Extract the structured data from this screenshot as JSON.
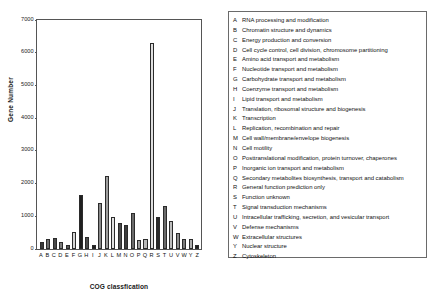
{
  "chart_data": {
    "type": "bar",
    "title": "",
    "xlabel": "COG classfication",
    "ylabel": "Gene Number",
    "ylim": [
      0,
      7000
    ],
    "yticks": [
      0,
      1000,
      2000,
      3000,
      4000,
      5000,
      6000,
      7000
    ],
    "ytick_labels": [
      "0",
      "1000",
      "2000",
      "3000",
      "4000",
      "5000",
      "6000",
      "7000"
    ],
    "grid": false,
    "legend_position": "right",
    "categories": [
      "A",
      "B",
      "C",
      "D",
      "E",
      "F",
      "G",
      "H",
      "I",
      "J",
      "K",
      "L",
      "M",
      "N",
      "O",
      "P",
      "Q",
      "R",
      "S",
      "T",
      "U",
      "V",
      "W",
      "Y",
      "Z"
    ],
    "values": [
      215,
      320,
      350,
      225,
      120,
      510,
      1650,
      380,
      110,
      1410,
      2230,
      985,
      800,
      740,
      1110,
      280,
      310,
      6300,
      985,
      1310,
      860,
      500,
      300,
      300,
      120
    ],
    "bar_colors": [
      "#3a3a3a",
      "#6e6e6e",
      "#4a4a4a",
      "#7d7d7d",
      "#5a5a5a",
      "#d6d6d6",
      "#1f1f1f",
      "#4e4e4e",
      "#1f1f1f",
      "#8a8a8a",
      "#9e9e9e",
      "#e2e2e2",
      "#4a4a4a",
      "#3d3d3d",
      "#6a6a6a",
      "#9a9a9a",
      "#b8b8b8",
      "#e0e0e0",
      "#2a2a2a",
      "#6a6a6a",
      "#bdbdbd",
      "#8e8e8e",
      "#7a7a7a",
      "#b0b0b0",
      "#1f1f1f"
    ],
    "legend_entries": [
      {
        "key": "A",
        "desc": "RNA processing and modification"
      },
      {
        "key": "B",
        "desc": "Chromatin structure and dynamics"
      },
      {
        "key": "C",
        "desc": "Energy production and conversion"
      },
      {
        "key": "D",
        "desc": "Cell cycle control, cell division, chromosome partitioning"
      },
      {
        "key": "E",
        "desc": "Amino acid transport and metabolism"
      },
      {
        "key": "F",
        "desc": "Nucleotide transport and metabolism"
      },
      {
        "key": "G",
        "desc": "Carbohydrate transport and metabolism"
      },
      {
        "key": "H",
        "desc": "Coenzyme transport and metabolism"
      },
      {
        "key": "I",
        "desc": "Lipid transport and metabolism"
      },
      {
        "key": "J",
        "desc": "Translation, ribosomal structure and biogenesis"
      },
      {
        "key": "K",
        "desc": "Transcription"
      },
      {
        "key": "L",
        "desc": "Replication, recombination and repair"
      },
      {
        "key": "M",
        "desc": "Cell wall/membrane/envelope biogenesis"
      },
      {
        "key": "N",
        "desc": "Cell motility"
      },
      {
        "key": "O",
        "desc": "Posttranslational modification, protein turnover, chaperones"
      },
      {
        "key": "P",
        "desc": "Inorganic ion transport and metabolism"
      },
      {
        "key": "Q",
        "desc": "Secondary metabolites biosynthesis, transport and catabolism"
      },
      {
        "key": "R",
        "desc": "General function prediction only"
      },
      {
        "key": "S",
        "desc": "Function unknown"
      },
      {
        "key": "T",
        "desc": "Signal transduction mechanisms"
      },
      {
        "key": "U",
        "desc": "Intracellular trafficking, secretion, and vesicular transport"
      },
      {
        "key": "V",
        "desc": "Defense mechanisms"
      },
      {
        "key": "W",
        "desc": "Extracellular structures"
      },
      {
        "key": "Y",
        "desc": "Nuclear structure"
      },
      {
        "key": "Z",
        "desc": "Cytoskeleton"
      }
    ]
  }
}
